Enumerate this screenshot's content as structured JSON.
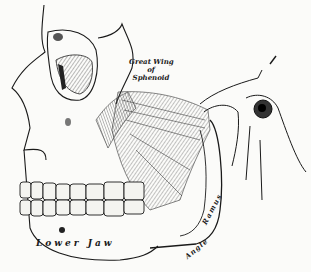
{
  "figure": {
    "style": "engraving",
    "colors": {
      "ink": "#1a1a1a",
      "paper": "#fbfbf9",
      "shade": "#8a8a86"
    }
  },
  "labels": {
    "great_wing_line1": "Great Wing",
    "great_wing_line2": "of",
    "great_wing_line3": "Sphenoid",
    "lower_jaw": "Lower Jaw",
    "ramus": "Ramus",
    "angle": "Angle"
  }
}
